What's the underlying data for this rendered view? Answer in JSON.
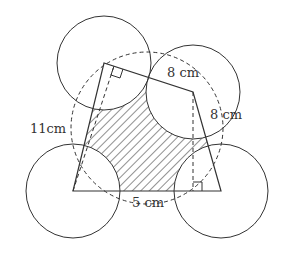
{
  "figure": {
    "type": "geometry-diagram",
    "labels": {
      "left_dashed": "11cm",
      "top_right_dashed": "8 cm",
      "right_dashed": "8 cm",
      "bottom_dashed": "5 cm"
    },
    "colors": {
      "stroke": "#333333",
      "background": "#ffffff",
      "hatch": "#333333"
    },
    "vertices": {
      "A": [
        73,
        191
      ],
      "B": [
        104,
        63
      ],
      "C": [
        193,
        92
      ],
      "D": [
        221,
        191
      ]
    },
    "circle_radius": 47,
    "dashed_circle": {
      "center": [
        147,
        128
      ],
      "radius": 76
    }
  }
}
